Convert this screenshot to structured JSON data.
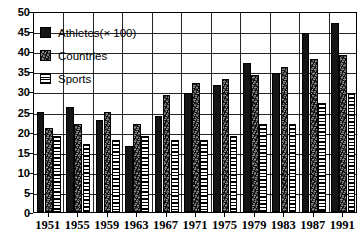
{
  "chart_data": {
    "type": "bar",
    "title": "",
    "subtitle": "",
    "xlabel": "",
    "ylabel": "",
    "ylim": [
      0,
      50
    ],
    "ytick_step": 5,
    "yticks": [
      0,
      5,
      10,
      15,
      20,
      25,
      30,
      35,
      40,
      45,
      50
    ],
    "grid": true,
    "grid_axes": "both",
    "legend_position": "upper-left-inside",
    "categories": [
      "1951",
      "1955",
      "1959",
      "1963",
      "1967",
      "1971",
      "1975",
      "1979",
      "1983",
      "1987",
      "1991"
    ],
    "series": [
      {
        "name": "Athletes(× 100)",
        "pattern": "solid-black",
        "color": "#151515",
        "values": [
          25,
          26,
          23,
          16.5,
          24,
          29.5,
          31.5,
          37,
          34.5,
          44.5,
          47
        ]
      },
      {
        "name": "Countries",
        "pattern": "speckled-gray",
        "color": "#8d8d8d",
        "values": [
          21,
          22,
          25,
          22,
          29,
          32,
          33,
          34,
          36,
          38,
          39
        ]
      },
      {
        "name": "Sports",
        "pattern": "horizontal-stripes",
        "color": "#ffffff",
        "values": [
          19,
          17,
          18,
          19,
          18,
          18,
          19,
          22,
          22,
          27,
          29.5
        ]
      }
    ]
  },
  "legend": {
    "items": [
      {
        "label": "Athletes(× 100)",
        "swatch": "athletes"
      },
      {
        "label": "Countries",
        "swatch": "countries"
      },
      {
        "label": "Sports",
        "swatch": "sports"
      }
    ]
  }
}
